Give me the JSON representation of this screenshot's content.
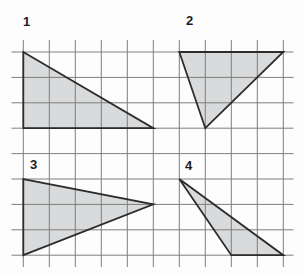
{
  "figure": {
    "background_color": "#fdfdfd",
    "grid": {
      "line_color": "#7e7e7e",
      "line_width": 1,
      "origin_x": 23.3,
      "origin_y": 52,
      "cell_w": 26,
      "cell_h": 25.4,
      "cols": 10,
      "rows": 8,
      "vertical_line_y_extent": [
        40,
        267
      ],
      "horizontal_line_x_extent": [
        11.5,
        293.5
      ]
    },
    "shape_style": {
      "fill_color": "#d9dadb",
      "stroke_color": "#2c2c2c",
      "stroke_width": 1.8,
      "label_color": "#1c1c1c"
    },
    "shapes": [
      {
        "label": "1",
        "type": "triangle",
        "vertices_cells": [
          [
            0,
            0
          ],
          [
            0,
            3
          ],
          [
            5,
            3
          ]
        ],
        "label_xy": [
          23,
          26
        ]
      },
      {
        "label": "2",
        "type": "triangle",
        "vertices_cells": [
          [
            6,
            0
          ],
          [
            10,
            0
          ],
          [
            7,
            3
          ]
        ],
        "label_xy": [
          186,
          25
        ]
      },
      {
        "label": "3",
        "type": "triangle",
        "vertices_cells": [
          [
            0,
            5
          ],
          [
            0,
            8
          ],
          [
            5,
            6
          ]
        ],
        "label_xy": [
          30,
          169
        ]
      },
      {
        "label": "4",
        "type": "triangle",
        "vertices_cells": [
          [
            6,
            5
          ],
          [
            8,
            8
          ],
          [
            10,
            8
          ]
        ],
        "label_xy": [
          185,
          170
        ]
      }
    ]
  }
}
